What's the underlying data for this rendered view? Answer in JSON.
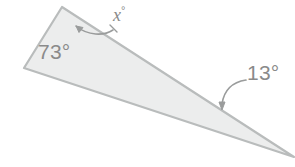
{
  "figure": {
    "kind": "geometry-diagram",
    "shape": "triangle",
    "canvas": {
      "width": 295,
      "height": 167
    },
    "colors": {
      "background": "#ffffff",
      "triangle_fill": "#eceded",
      "triangle_stroke": "#b9bcbc",
      "label_text": "#8a8a8a",
      "arrow": "#9a9c9c"
    },
    "triangle": {
      "vertices": [
        {
          "name": "left-vertex",
          "x": 24,
          "y": 68
        },
        {
          "name": "top-vertex",
          "x": 62,
          "y": 7
        },
        {
          "name": "right-apex",
          "x": 294,
          "y": 157
        }
      ]
    },
    "labels": {
      "left_angle": "73°",
      "unknown_angle_value": "x",
      "unknown_angle_degree": "°",
      "right_angle": "13°"
    },
    "arrows": [
      {
        "name": "x-angle-arrow",
        "points_to": "top-vertex",
        "style": "curved-with-arrowhead"
      },
      {
        "name": "thirteen-degree-arrow",
        "points_to": "lower-right-interior",
        "style": "curved-with-arrowhead"
      }
    ]
  }
}
